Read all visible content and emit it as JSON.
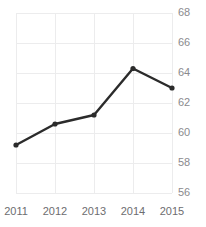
{
  "chart_data": {
    "type": "line",
    "title": "",
    "xlabel": "",
    "ylabel": "",
    "categories": [
      "2011",
      "2012",
      "2013",
      "2014",
      "2015"
    ],
    "x": [
      2011,
      2012,
      2013,
      2014,
      2015
    ],
    "values": [
      59.2,
      60.6,
      61.2,
      64.3,
      63.0
    ],
    "series": [
      {
        "name": "series-1",
        "values": [
          59.2,
          60.6,
          61.2,
          64.3,
          63.0
        ],
        "color": "#2b2b2b",
        "marker": "circle",
        "line_width": 2.4
      }
    ],
    "ylim": [
      56,
      68
    ],
    "yticks": [
      56,
      58,
      60,
      62,
      64,
      66,
      68
    ],
    "ytick_labels": [
      "56",
      "58",
      "60",
      "62",
      "64",
      "66",
      "68"
    ],
    "xticks": [
      2011,
      2012,
      2013,
      2014,
      2015
    ],
    "xtick_labels": [
      "2011",
      "2012",
      "2013",
      "2014",
      "2015"
    ],
    "y_axis_position": "right",
    "grid": true,
    "grid_color": "#ececed",
    "legend": false,
    "legend_position": "none"
  },
  "axes": {
    "y_tick_label_color": "#8a8a8e",
    "x_tick_label_color": "#6d6d70"
  }
}
